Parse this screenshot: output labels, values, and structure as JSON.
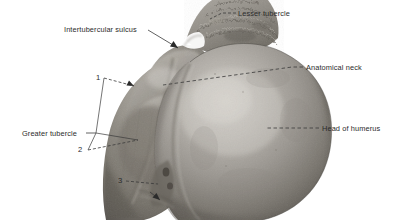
{
  "figure": {
    "kind": "anatomical-specimen-photograph",
    "background_color": "#ffffff",
    "text_color": "#2b2b2b",
    "leader_color": "#3a3a3a",
    "width": 402,
    "height": 220
  },
  "labels": [
    {
      "id": "lesser-tubercle",
      "text": "Lesser tubercle",
      "x": 238,
      "y": 10,
      "align": "left"
    },
    {
      "id": "intertubercular-sulcus",
      "text": "Intertubercular sulcus",
      "x": 64,
      "y": 33,
      "align": "left"
    },
    {
      "id": "anatomical-neck",
      "text": "Anatomical neck",
      "x": 306,
      "y": 64,
      "align": "left"
    },
    {
      "id": "head-of-humerus",
      "text": "Head of humerus",
      "x": 322,
      "y": 124,
      "align": "left"
    },
    {
      "id": "greater-tubercle",
      "text": "Greater tubercle",
      "x": 22,
      "y": 129,
      "align": "left"
    }
  ],
  "numbers": [
    {
      "id": "callout-1",
      "text": "1",
      "x": 98,
      "y": 74
    },
    {
      "id": "callout-2",
      "text": "2",
      "x": 80,
      "y": 147
    },
    {
      "id": "callout-3",
      "text": "3",
      "x": 120,
      "y": 178
    }
  ],
  "tones": {
    "head_highlight": "#c9c6c0",
    "head_mid": "#9c9892",
    "head_shadow": "#595busted",
    "tubercle_dark": "#6e6a65",
    "crest_rough": "#8a8680"
  }
}
